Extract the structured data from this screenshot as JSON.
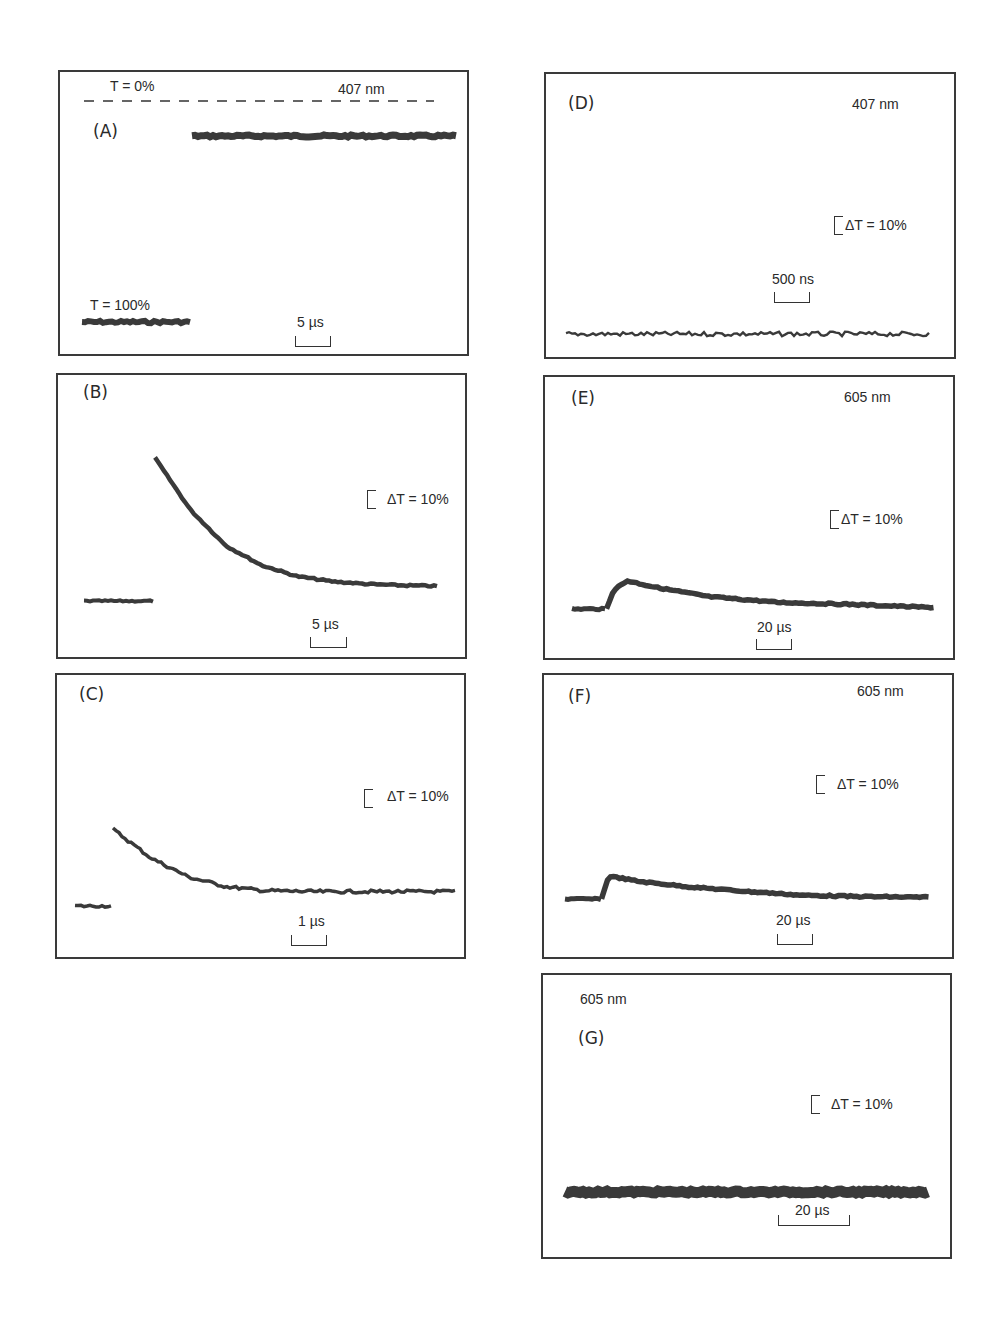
{
  "figure": {
    "panels": [
      {
        "id": "A",
        "label": "(A)",
        "wavelength": "407 nm",
        "time_scale": "5 µs",
        "t0_label": "T = 0%",
        "t100_label": "T = 100%"
      },
      {
        "id": "B",
        "label": "(B)",
        "wavelength": "",
        "time_scale": "5 µs",
        "delta_t": "ΔT = 10%"
      },
      {
        "id": "C",
        "label": "(C)",
        "wavelength": "",
        "time_scale": "1 µs",
        "delta_t": "ΔT = 10%"
      },
      {
        "id": "D",
        "label": "(D)",
        "wavelength": "407 nm",
        "time_scale": "500 ns",
        "delta_t": "ΔT = 10%"
      },
      {
        "id": "E",
        "label": "(E)",
        "wavelength": "605 nm",
        "time_scale": "20 µs",
        "delta_t": "ΔT = 10%"
      },
      {
        "id": "F",
        "label": "(F)",
        "wavelength": "605 nm",
        "time_scale": "20 µs",
        "delta_t": "ΔT = 10%"
      },
      {
        "id": "G",
        "label": "(G)",
        "wavelength": "605 nm",
        "time_scale": "20 µs",
        "delta_t": "ΔT = 10%"
      }
    ]
  },
  "chart_data": [
    {
      "type": "line",
      "panel": "A",
      "title": "(A) 407 nm",
      "xlabel": "time (scale bar 5 µs)",
      "ylabel": "Transmission",
      "annotations": [
        "T = 0%",
        "T = 100%",
        "407 nm",
        "5 µs"
      ],
      "series": [
        {
          "name": "pre-flash",
          "x": [
            0,
            1
          ],
          "y": [
            100,
            100
          ]
        },
        {
          "name": "post-flash",
          "x": [
            1,
            3.4
          ],
          "y": [
            15,
            15
          ]
        }
      ],
      "reference_line": {
        "label": "T = 0%",
        "style": "dashed"
      }
    },
    {
      "type": "line",
      "panel": "B",
      "title": "(B)",
      "xlabel": "time (scale bar 5 µs)",
      "ylabel": "ΔT",
      "annotations": [
        "ΔT = 10%",
        "5 µs"
      ],
      "series": [
        {
          "name": "pre-flash",
          "x": [
            0,
            1
          ],
          "y": [
            0,
            0
          ]
        },
        {
          "name": "decay",
          "x": [
            1,
            1.5,
            2,
            2.5,
            3,
            3.5,
            4,
            4.5,
            5
          ],
          "y": [
            22,
            14,
            8.5,
            5.5,
            3.8,
            3,
            2.6,
            2.4,
            2.3
          ]
        }
      ]
    },
    {
      "type": "line",
      "panel": "C",
      "title": "(C)",
      "xlabel": "time (scale bar 1 µs)",
      "ylabel": "ΔT",
      "annotations": [
        "ΔT = 10%",
        "1 µs"
      ],
      "series": [
        {
          "name": "pre-flash",
          "x": [
            0,
            0.4
          ],
          "y": [
            0,
            0
          ]
        },
        {
          "name": "decay",
          "x": [
            0.4,
            0.8,
            1.2,
            1.6,
            2,
            2.5,
            3,
            3.5,
            4
          ],
          "y": [
            16,
            10,
            6,
            4,
            3.2,
            3,
            3,
            3,
            3
          ]
        }
      ]
    },
    {
      "type": "line",
      "panel": "D",
      "title": "(D) 407 nm",
      "xlabel": "time (scale bar 500 ns)",
      "ylabel": "ΔT",
      "annotations": [
        "407 nm",
        "ΔT = 10%",
        "500 ns"
      ],
      "series": [
        {
          "name": "flat noise",
          "x": [
            0,
            10
          ],
          "y": [
            0,
            0
          ]
        }
      ]
    },
    {
      "type": "line",
      "panel": "E",
      "title": "(E) 605 nm",
      "xlabel": "time (scale bar 20 µs)",
      "ylabel": "ΔT",
      "annotations": [
        "605 nm",
        "ΔT = 10%",
        "20 µs"
      ],
      "series": [
        {
          "name": "pre-flash",
          "x": [
            0,
            1
          ],
          "y": [
            0,
            0
          ]
        },
        {
          "name": "rise-decay",
          "x": [
            1,
            1.2,
            1.6,
            2.5,
            4,
            6,
            8,
            10.5
          ],
          "y": [
            0,
            4,
            6,
            4.5,
            2.6,
            1.4,
            1,
            0.3
          ]
        }
      ]
    },
    {
      "type": "line",
      "panel": "F",
      "title": "(F) 605 nm",
      "xlabel": "time (scale bar 20 µs)",
      "ylabel": "ΔT",
      "annotations": [
        "605 nm",
        "ΔT = 10%",
        "20 µs"
      ],
      "series": [
        {
          "name": "pre-flash",
          "x": [
            0,
            1
          ],
          "y": [
            0,
            0
          ]
        },
        {
          "name": "decay",
          "x": [
            1,
            1.2,
            2,
            3.5,
            5,
            6.5,
            8,
            10
          ],
          "y": [
            0,
            5.5,
            4.2,
            2.8,
            1.8,
            0.9,
            0.6,
            0.4
          ]
        }
      ]
    },
    {
      "type": "line",
      "panel": "G",
      "title": "(G) 605 nm",
      "xlabel": "time (scale bar 20 µs)",
      "ylabel": "ΔT",
      "annotations": [
        "605 nm",
        "ΔT = 10%",
        "20 µs"
      ],
      "series": [
        {
          "name": "flat",
          "x": [
            0,
            10
          ],
          "y": [
            0,
            0
          ]
        }
      ]
    }
  ]
}
